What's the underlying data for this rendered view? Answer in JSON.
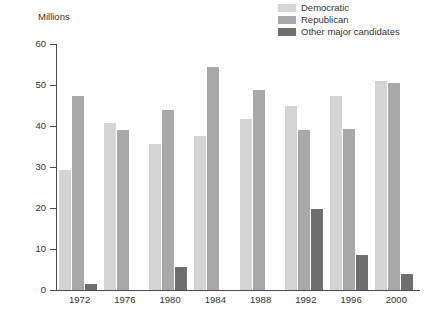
{
  "axis_title": "Millions",
  "legend": {
    "items": [
      {
        "label": "Democratic",
        "color": "#d4d4d4"
      },
      {
        "label": "Republican",
        "color": "#a8a8a8"
      },
      {
        "label": "Other major candidates",
        "color": "#6e6e6e"
      }
    ]
  },
  "chart_data": {
    "type": "bar",
    "title": "",
    "subtitle": "",
    "xlabel": "",
    "ylabel": "Millions",
    "ylim": [
      0,
      60
    ],
    "yticks": [
      0,
      10,
      20,
      30,
      40,
      50,
      60
    ],
    "ytick_labels": [
      "0",
      "10",
      "20",
      "30",
      "40",
      "50",
      "60"
    ],
    "grid": false,
    "legend_position": "top-right",
    "categories": [
      "1972",
      "1976",
      "1980",
      "1984",
      "1988",
      "1992",
      "1996",
      "2000"
    ],
    "series": [
      {
        "name": "Democratic",
        "color": "#d4d4d4",
        "values": [
          29.2,
          40.8,
          35.5,
          37.6,
          41.8,
          44.9,
          47.4,
          51.0
        ]
      },
      {
        "name": "Republican",
        "color": "#a8a8a8",
        "values": [
          47.2,
          39.1,
          43.9,
          54.5,
          48.9,
          39.1,
          39.2,
          50.5
        ]
      },
      {
        "name": "Other major candidates",
        "color": "#6e6e6e",
        "values": [
          1.4,
          0,
          5.7,
          0,
          0,
          19.7,
          8.6,
          3.9
        ]
      }
    ]
  }
}
